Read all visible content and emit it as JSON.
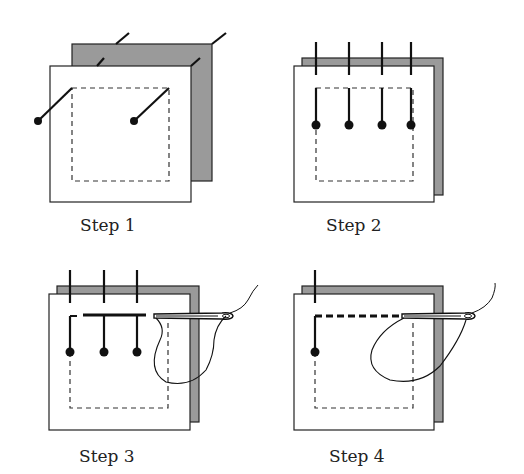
{
  "colors": {
    "background": "#ffffff",
    "back_layer": "#999999",
    "front_layer": "#ffffff",
    "ink": "#111111",
    "dash": "#333333"
  },
  "steps": [
    {
      "label": "Step 1",
      "description": "Two fabric layers offset; two diagonal pins inserted at corners"
    },
    {
      "label": "Step 2",
      "description": "Four vertical pins along the top edge"
    },
    {
      "label": "Step 3",
      "description": "Needle and thread basting along top edge, three pins remaining"
    },
    {
      "label": "Step 4",
      "description": "Basting stitches continue along top edge, one pin remaining"
    }
  ]
}
